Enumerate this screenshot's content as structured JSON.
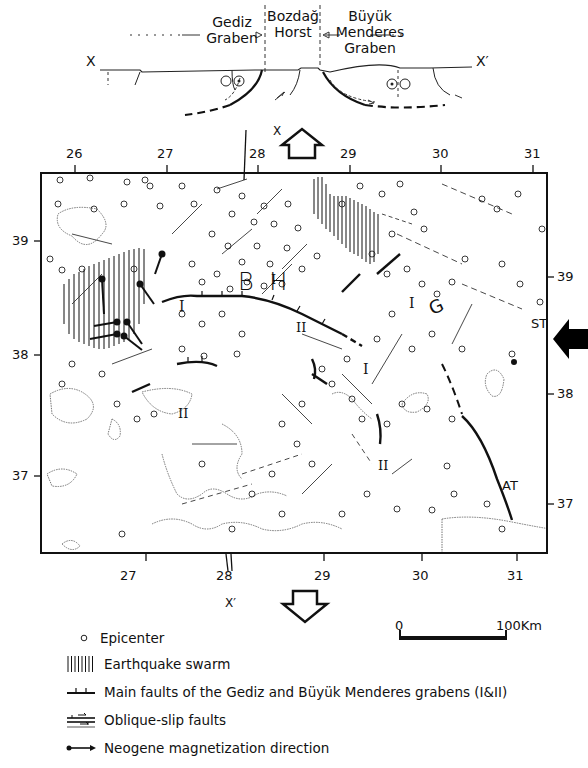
{
  "cross_section": {
    "labels": {
      "gediz": [
        "Gediz",
        "Graben"
      ],
      "bozdag": [
        "Bozdağ",
        "Horst"
      ],
      "buyuk": [
        "Büyük",
        "Menderes",
        "Graben"
      ],
      "x_left": "X",
      "x_right": "X′"
    }
  },
  "map": {
    "section_markers": {
      "top": "X",
      "bottom": "X′"
    },
    "lon_ticks": [
      "26",
      "27",
      "28",
      "29",
      "30",
      "31"
    ],
    "lon_ticks_bottom": [
      "27",
      "28",
      "29",
      "30",
      "31"
    ],
    "lat_ticks_left": [
      "39",
      "38",
      "37"
    ],
    "lat_ticks_right": [
      "39",
      "38",
      "37"
    ],
    "region_labels": {
      "bozdag_horst": "B H",
      "gediz_g": "G",
      "st": "ST",
      "at": "AT"
    },
    "fault_labels": [
      "I",
      "I",
      "I",
      "I",
      "II",
      "II",
      "II"
    ]
  },
  "scale_bar": {
    "start": "0",
    "end": "100Km"
  },
  "legend": {
    "items": [
      {
        "symbol": "open-circle",
        "label": "Epicenter"
      },
      {
        "symbol": "vertical-hatch",
        "label": "Earthquake swarm"
      },
      {
        "symbol": "ticked-fault",
        "label": "Main faults of the Gediz and Büyük Menderes grabens (I&II)"
      },
      {
        "symbol": "oblique-slip",
        "label": "Oblique-slip faults"
      },
      {
        "symbol": "dot-arrow",
        "label": "Neogene magnetization direction"
      }
    ]
  }
}
